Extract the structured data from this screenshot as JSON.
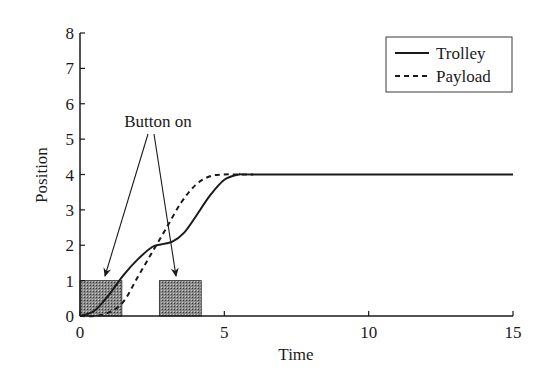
{
  "chart_data": {
    "type": "line",
    "title": "",
    "xlabel": "Time",
    "ylabel": "Position",
    "xlim": [
      0,
      15
    ],
    "ylim": [
      0,
      8
    ],
    "xticks": [
      0,
      5,
      10,
      15
    ],
    "yticks": [
      0,
      1,
      2,
      3,
      4,
      5,
      6,
      7,
      8
    ],
    "grid": false,
    "legend_position": "upper right",
    "series": [
      {
        "name": "Trolley",
        "style": "solid",
        "x": [
          0,
          0.5,
          1.0,
          1.5,
          2.0,
          2.5,
          2.8,
          3.2,
          3.6,
          4.0,
          4.5,
          5.0,
          5.5,
          6.0,
          10,
          15
        ],
        "y": [
          0,
          0.15,
          0.6,
          1.15,
          1.6,
          1.95,
          2.02,
          2.1,
          2.35,
          2.8,
          3.4,
          3.85,
          4.0,
          4.0,
          4.0,
          4.0
        ]
      },
      {
        "name": "Payload",
        "style": "dashed",
        "x": [
          0,
          0.5,
          1.0,
          1.5,
          2.0,
          2.5,
          3.0,
          3.5,
          4.0,
          4.5,
          5.0,
          5.5,
          6.0
        ],
        "y": [
          0,
          0.0,
          0.1,
          0.4,
          1.1,
          1.8,
          2.5,
          3.2,
          3.7,
          3.95,
          4.0,
          4.0,
          4.0
        ]
      }
    ],
    "shaded_regions": [
      {
        "label": "Button on",
        "x_start": 0,
        "x_end": 1.45,
        "y": 1
      },
      {
        "label": "Button on",
        "x_start": 2.75,
        "x_end": 4.2,
        "y": 1
      }
    ],
    "annotations": [
      {
        "text": "Button on",
        "x": 1.9,
        "y": 5.1,
        "arrows_to": [
          [
            0.8,
            1.0
          ],
          [
            3.3,
            1.0
          ]
        ]
      }
    ]
  },
  "labels": {
    "xlabel": "Time",
    "ylabel": "Position",
    "annotation": "Button on",
    "legend": [
      "Trolley",
      "Payload"
    ],
    "xticks": [
      "0",
      "5",
      "10",
      "15"
    ],
    "yticks": [
      "0",
      "1",
      "2",
      "3",
      "4",
      "5",
      "6",
      "7",
      "8"
    ]
  }
}
